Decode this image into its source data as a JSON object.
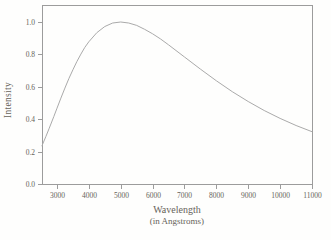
{
  "chart_data": {
    "type": "line",
    "title": "",
    "xlabel": "Wavelength",
    "xlabel_sub": "(in Angstroms)",
    "ylabel": "Intensity",
    "xlim": [
      2531,
      11000
    ],
    "ylim": [
      0,
      1.105
    ],
    "grid": false,
    "legend": "none",
    "frame": "full-box",
    "x_ticks": [
      {
        "value": 3000,
        "label": "3000"
      },
      {
        "value": 4000,
        "label": "4000"
      },
      {
        "value": 5000,
        "label": "5000"
      },
      {
        "value": 6000,
        "label": "6000"
      },
      {
        "value": 7000,
        "label": "7000"
      },
      {
        "value": 8000,
        "label": "8000"
      },
      {
        "value": 9000,
        "label": "9000"
      },
      {
        "value": 10000,
        "label": "10000"
      },
      {
        "value": 11000,
        "label": "11000"
      }
    ],
    "y_ticks": [
      {
        "value": 0.0,
        "label": "0.0"
      },
      {
        "value": 0.2,
        "label": "0.2"
      },
      {
        "value": 0.4,
        "label": "0.4"
      },
      {
        "value": 0.6,
        "label": "0.6"
      },
      {
        "value": 0.8,
        "label": "0.8"
      },
      {
        "value": 1.0,
        "label": "1.0"
      }
    ],
    "series": [
      {
        "name": "normalized-blackbody-intensity",
        "color": "#aaaaaa",
        "points": [
          [
            2531,
            0.236
          ],
          [
            2550,
            0.245
          ],
          [
            2650,
            0.292
          ],
          [
            2750,
            0.341
          ],
          [
            2900,
            0.416
          ],
          [
            3000,
            0.468
          ],
          [
            3125,
            0.53
          ],
          [
            3250,
            0.592
          ],
          [
            3375,
            0.651
          ],
          [
            3500,
            0.705
          ],
          [
            3625,
            0.756
          ],
          [
            3750,
            0.802
          ],
          [
            3875,
            0.843
          ],
          [
            4000,
            0.878
          ],
          [
            4250,
            0.934
          ],
          [
            4500,
            0.972
          ],
          [
            4750,
            0.994
          ],
          [
            5000,
            1.0
          ],
          [
            5250,
            0.994
          ],
          [
            5500,
            0.979
          ],
          [
            5750,
            0.955
          ],
          [
            6000,
            0.927
          ],
          [
            6250,
            0.895
          ],
          [
            6500,
            0.859
          ],
          [
            7000,
            0.784
          ],
          [
            7500,
            0.709
          ],
          [
            8000,
            0.637
          ],
          [
            8500,
            0.57
          ],
          [
            9000,
            0.509
          ],
          [
            9500,
            0.454
          ],
          [
            10000,
            0.405
          ],
          [
            10500,
            0.361
          ],
          [
            11000,
            0.323
          ]
        ]
      }
    ],
    "peak": {
      "wavelength": 5000,
      "intensity": 1.0
    },
    "colors": {
      "frame": "#9c9c9c",
      "tick": "#9c9c9c",
      "curve": "#aaaaaa",
      "text": "#66625a",
      "background": "#fefefd"
    }
  }
}
